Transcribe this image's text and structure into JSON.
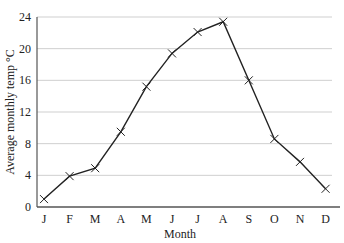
{
  "chart_data": {
    "type": "line",
    "title": "",
    "xlabel": "Month",
    "ylabel": "Average monthly temp °C",
    "categories": [
      "J",
      "F",
      "M",
      "A",
      "M",
      "J",
      "J",
      "A",
      "S",
      "O",
      "N",
      "D"
    ],
    "series": [
      {
        "name": "Average monthly temp",
        "values": [
          1.0,
          3.9,
          4.9,
          9.5,
          15.2,
          19.4,
          22.1,
          23.4,
          16.0,
          8.6,
          5.7,
          2.3
        ]
      }
    ],
    "ylim": [
      0,
      24
    ],
    "yticks": [
      0,
      4,
      8,
      12,
      16,
      20,
      24
    ],
    "grid": true,
    "legend": "none",
    "marker": "x",
    "colors": {
      "line": "#222222",
      "grid": "#cfcfcf",
      "axis": "#555555"
    }
  }
}
